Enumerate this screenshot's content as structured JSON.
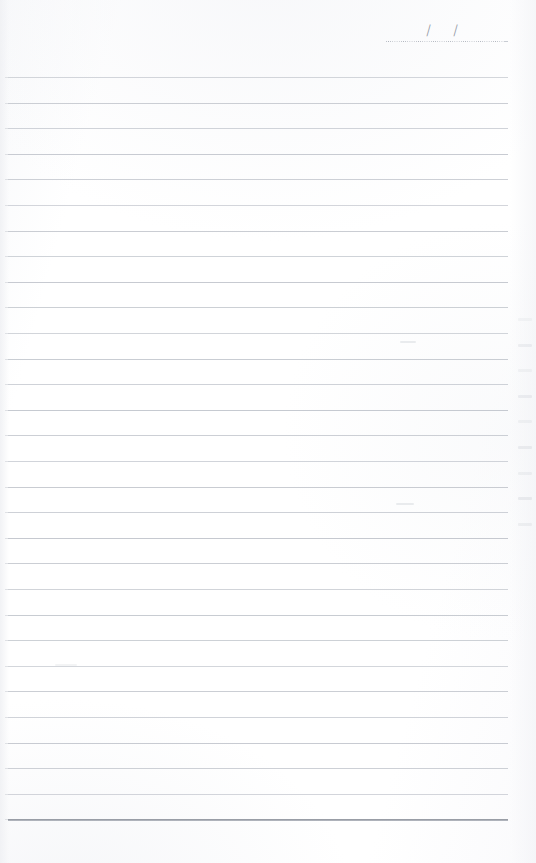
{
  "document": {
    "type": "lined-notebook-page",
    "title": "Blank Ruled Notebook Page",
    "paper_color": "#fdfdfe",
    "rule_color": "#c2c6cd",
    "bottom_rule_color": "#8e939c",
    "body_text": ""
  },
  "date_field": {
    "label": "",
    "value": "",
    "placeholder": "/  /",
    "separator_1": "/",
    "separator_2": "/",
    "left": 386,
    "top": 20,
    "width": 122
  },
  "rules": {
    "count": 30,
    "first_line_y": 77,
    "spacing": 25.6,
    "left": 8,
    "right": 508,
    "last_line_y": 823,
    "last_line_emphasis": "bold"
  },
  "marks": {
    "bleed_through_right_margin": 9,
    "smudges": 3
  }
}
